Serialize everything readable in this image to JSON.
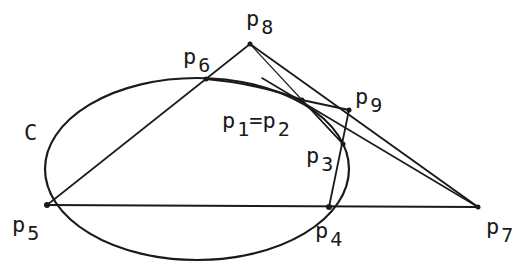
{
  "diagram": {
    "curve_label": "C",
    "points": {
      "p1p2": {
        "label": "p",
        "sub": "1",
        "eq": "=p",
        "sub2": "2"
      },
      "p3": {
        "label": "p",
        "sub": "3"
      },
      "p4": {
        "label": "p",
        "sub": "4"
      },
      "p5": {
        "label": "p",
        "sub": "5"
      },
      "p6": {
        "label": "p",
        "sub": "6"
      },
      "p7": {
        "label": "p",
        "sub": "7"
      },
      "p8": {
        "label": "p",
        "sub": "8"
      },
      "p9": {
        "label": "p",
        "sub": "9"
      }
    },
    "stroke_color": "#1a1a1a",
    "background": "#ffffff"
  }
}
